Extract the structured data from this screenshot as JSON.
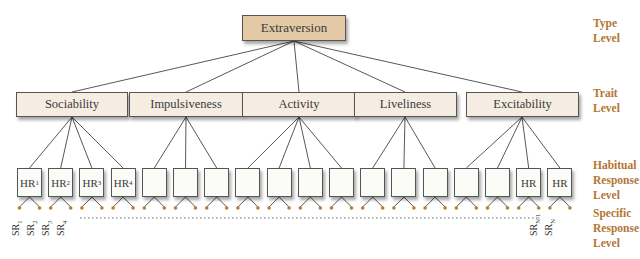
{
  "type_level": {
    "label": "Extraversion"
  },
  "traits": [
    {
      "label": "Sociability"
    },
    {
      "label": "Impulsiveness"
    },
    {
      "label": "Activity"
    },
    {
      "label": "Liveliness"
    },
    {
      "label": "Excitability"
    }
  ],
  "habitual_responses": [
    {
      "base": "HR",
      "sub": "1"
    },
    {
      "base": "HR",
      "sub": "2"
    },
    {
      "base": "HR",
      "sub": "3"
    },
    {
      "base": "HR",
      "sub": "4"
    },
    {
      "base": "",
      "sub": ""
    },
    {
      "base": "",
      "sub": ""
    },
    {
      "base": "",
      "sub": ""
    },
    {
      "base": "",
      "sub": ""
    },
    {
      "base": "",
      "sub": ""
    },
    {
      "base": "",
      "sub": ""
    },
    {
      "base": "",
      "sub": ""
    },
    {
      "base": "",
      "sub": ""
    },
    {
      "base": "",
      "sub": ""
    },
    {
      "base": "",
      "sub": ""
    },
    {
      "base": "",
      "sub": ""
    },
    {
      "base": "",
      "sub": ""
    },
    {
      "base": "HR",
      "sub": ""
    },
    {
      "base": "HR",
      "sub": ""
    }
  ],
  "specific_responses": [
    {
      "base": "SR",
      "sub": "1"
    },
    {
      "base": "SR",
      "sub": "2"
    },
    {
      "base": "SR",
      "sub": "3"
    },
    {
      "base": "SR",
      "sub": "4"
    },
    {
      "base": "SR",
      "sub": "N-1"
    },
    {
      "base": "SR",
      "sub": "N"
    }
  ],
  "levels": {
    "type": [
      "Type",
      "Level"
    ],
    "trait": [
      "Trait",
      "Level"
    ],
    "habitual": [
      "Habitual",
      "Response",
      "Level"
    ],
    "specific": [
      "Specific",
      "Response",
      "Level"
    ]
  },
  "colors": {
    "accent": "#b57533",
    "type_box": "#e3c9a6",
    "trait_box": "#f5ede2",
    "dot": "#c07a30"
  }
}
